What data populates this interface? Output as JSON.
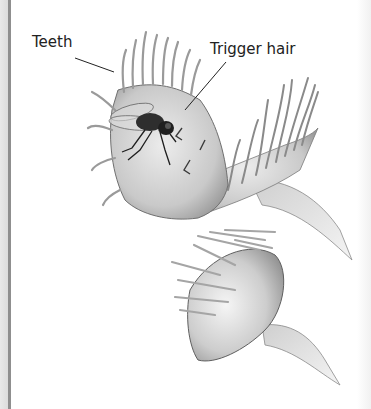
{
  "figure": {
    "labels": {
      "teeth": "Teeth",
      "trigger_hair": "Trigger hair"
    }
  }
}
